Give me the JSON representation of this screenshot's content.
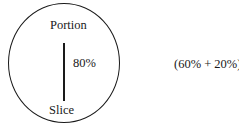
{
  "diagram": {
    "shape": "circle",
    "top_label": "Portion",
    "value_label": "80%",
    "bottom_label": "Slice",
    "annotation": "(60% + 20%)",
    "stroke_color": "#1a1a1a",
    "background": "#ffffff"
  }
}
